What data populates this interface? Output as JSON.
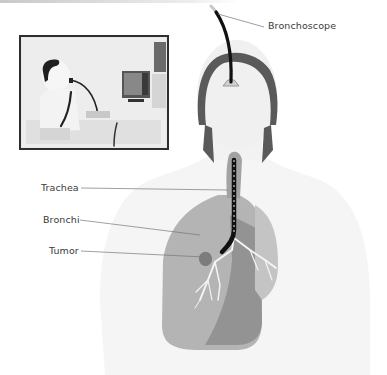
{
  "diagram": {
    "labels": {
      "bronchoscope": "Bronchoscope",
      "trachea": "Trachea",
      "bronchi": "Bronchi",
      "tumor": "Tumor"
    },
    "inset": {
      "description": "Patient undergoing bronchoscopy with video monitor"
    },
    "colors": {
      "outline": "#5a5a5a",
      "scope": "#111111",
      "lung_light": "#b9b9b9",
      "lung_dark": "#8f8f8f",
      "body": "#f4f4f4",
      "tumor": "#7a7a7a"
    }
  }
}
